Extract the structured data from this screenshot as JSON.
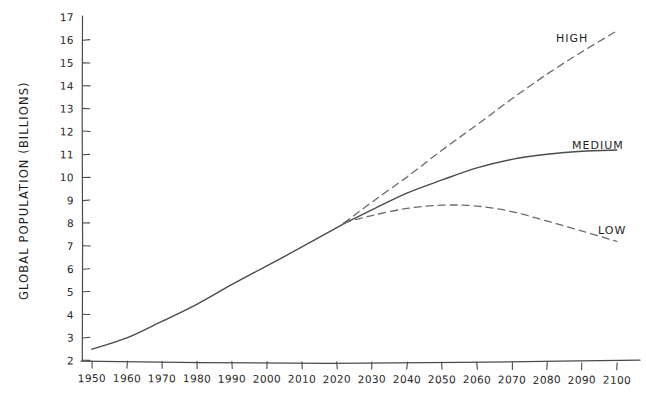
{
  "chart_data": {
    "type": "line",
    "title": "",
    "xlabel": "",
    "ylabel": "GLOBAL POPULATION (BILLIONS)",
    "xlim": [
      1950,
      2100
    ],
    "ylim": [
      2,
      17
    ],
    "grid": false,
    "legend_position": "inline-right-of-line-ends",
    "style": "hand-drawn sketch",
    "x_tick_labels": [
      "1950",
      "1960",
      "1970",
      "1980",
      "1990",
      "2000",
      "2010",
      "2020",
      "2030",
      "2040",
      "2050",
      "2060",
      "2070",
      "2080",
      "2090",
      "2100"
    ],
    "y_tick_labels": [
      "2",
      "3",
      "4",
      "5",
      "6",
      "7",
      "8",
      "9",
      "10",
      "11",
      "12",
      "13",
      "14",
      "15",
      "16",
      "17"
    ],
    "branch_point": {
      "x": 2022,
      "y": 8.0
    },
    "series": [
      {
        "name": "HISTORICAL",
        "label": "",
        "style": "solid",
        "x": [
          1950,
          1960,
          1970,
          1980,
          1990,
          2000,
          2010,
          2020,
          2022
        ],
        "values": [
          2.5,
          3.0,
          3.7,
          4.45,
          5.3,
          6.15,
          6.95,
          7.8,
          8.0
        ]
      },
      {
        "name": "HIGH",
        "label": "HIGH",
        "style": "dashed",
        "x": [
          2022,
          2030,
          2040,
          2050,
          2060,
          2070,
          2080,
          2090,
          2100
        ],
        "values": [
          8.0,
          8.9,
          10.0,
          11.2,
          12.3,
          13.4,
          14.5,
          15.5,
          16.4
        ]
      },
      {
        "name": "MEDIUM",
        "label": "MEDIUM",
        "style": "solid",
        "x": [
          2022,
          2030,
          2040,
          2050,
          2060,
          2070,
          2080,
          2090,
          2100
        ],
        "values": [
          8.0,
          8.6,
          9.3,
          9.9,
          10.4,
          10.8,
          11.0,
          11.15,
          11.2
        ]
      },
      {
        "name": "LOW",
        "label": "LOW",
        "style": "dashed",
        "x": [
          2022,
          2030,
          2040,
          2050,
          2060,
          2070,
          2080,
          2090,
          2100
        ],
        "values": [
          8.0,
          8.35,
          8.65,
          8.8,
          8.75,
          8.5,
          8.1,
          7.65,
          7.2
        ]
      }
    ]
  },
  "axes": {
    "y_title": "GLOBAL POPULATION (BILLIONS)",
    "y_ticks": [
      "17",
      "16",
      "15",
      "14",
      "13",
      "12",
      "11",
      "10",
      "9",
      "8",
      "7",
      "6",
      "5",
      "4",
      "3",
      "2"
    ],
    "x_ticks": [
      "1950",
      "1960",
      "1970",
      "1980",
      "1990",
      "2000",
      "2010",
      "2020",
      "2030",
      "2040",
      "2050",
      "2060",
      "2070",
      "2080",
      "2090",
      "2100"
    ]
  },
  "annotations": {
    "high": "HIGH",
    "medium": "MEDIUM",
    "low": "LOW"
  },
  "colors": {
    "background": "#ffffff",
    "axis": "#4a4a4a",
    "solid_line": "#4c4c4c",
    "dashed_line": "#6b6b6b",
    "text": "#1f1f1f"
  }
}
